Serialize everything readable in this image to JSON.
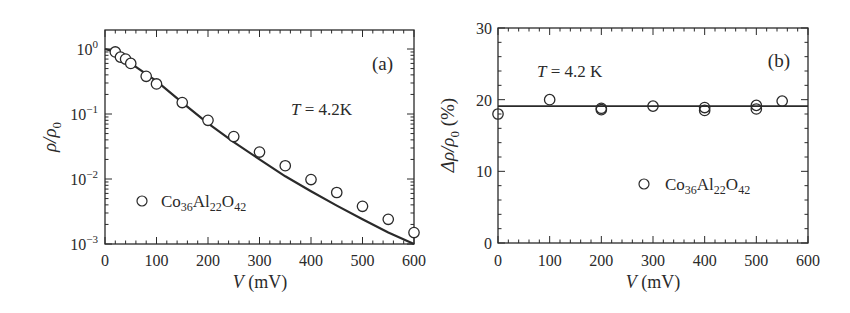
{
  "chart_data": [
    {
      "panel": "(a)",
      "type": "scatter",
      "title": "",
      "xlabel": "V (mV)",
      "ylabel": "ρ/ρ0",
      "xlim": [
        0,
        600
      ],
      "ylim": [
        0.001,
        1
      ],
      "yscale": "log",
      "xticks": [
        0,
        100,
        200,
        300,
        400,
        500,
        600
      ],
      "yticks": [
        "10^0",
        "10^-1",
        "10^-2",
        "10^-3"
      ],
      "grid": false,
      "legend_position": "lower-left inside",
      "annotations": [
        "T = 4.2K",
        "(a)"
      ],
      "series": [
        {
          "name": "Co36Al22O42",
          "marker": "open-circle",
          "x": [
            20,
            30,
            40,
            50,
            80,
            100,
            150,
            200,
            250,
            300,
            350,
            400,
            450,
            500,
            550,
            600
          ],
          "y": [
            0.9,
            0.75,
            0.7,
            0.6,
            0.38,
            0.29,
            0.15,
            0.08,
            0.045,
            0.026,
            0.016,
            0.0098,
            0.0062,
            0.0038,
            0.0024,
            0.0015
          ]
        },
        {
          "name": "fit",
          "line": "solid",
          "x": [
            0,
            10,
            50,
            100,
            150,
            200,
            250,
            300,
            350,
            400,
            450,
            500,
            550,
            600
          ],
          "y": [
            1.0,
            0.95,
            0.6,
            0.32,
            0.15,
            0.072,
            0.037,
            0.02,
            0.011,
            0.0065,
            0.0039,
            0.0024,
            0.0015,
            0.001
          ]
        }
      ]
    },
    {
      "panel": "(b)",
      "type": "scatter",
      "title": "",
      "xlabel": "V (mV)",
      "ylabel": "Δρ/ρ0 (%)",
      "xlim": [
        0,
        600
      ],
      "ylim": [
        0,
        30
      ],
      "xticks": [
        0,
        100,
        200,
        300,
        400,
        500,
        600
      ],
      "yticks": [
        0,
        10,
        20,
        30
      ],
      "grid": false,
      "legend_position": "lower-right inside",
      "annotations": [
        "T = 4.2 K",
        "(b)"
      ],
      "series": [
        {
          "name": "Co36Al22O42",
          "marker": "open-circle",
          "x": [
            0,
            100,
            200,
            200,
            300,
            400,
            400,
            500,
            500,
            550
          ],
          "y": [
            18.0,
            20.0,
            18.6,
            18.8,
            19.1,
            18.5,
            18.9,
            18.7,
            19.2,
            19.8
          ]
        },
        {
          "name": "fit",
          "line": "solid",
          "x": [
            0,
            600
          ],
          "y": [
            19.1,
            19.1
          ]
        }
      ]
    }
  ],
  "panels": {
    "a": {
      "label": "(a)",
      "temp_T": "T",
      "temp_rest": " = 4.2K",
      "ylabel_main": "ρ/ρ",
      "ylabel_sub": "0",
      "xlabel_var": "V",
      "xlabel_unit": " (mV)",
      "xtick_labels": [
        "0",
        "100",
        "200",
        "300",
        "400",
        "500",
        "600"
      ],
      "ytick_base": "10",
      "ytick_exps": [
        "0",
        "−1",
        "−2",
        "−3"
      ],
      "legend": {
        "co": "Co",
        "s1": "36",
        "al": "Al",
        "s2": "22",
        "o": "O",
        "s3": "42"
      }
    },
    "b": {
      "label": "(b)",
      "temp_T": "T",
      "temp_rest": " = 4.2 K",
      "ylabel_main": "Δρ/ρ",
      "ylabel_sub": "0",
      "ylabel_unit": " (%)",
      "xlabel_var": "V",
      "xlabel_unit": " (mV)",
      "xtick_labels": [
        "0",
        "100",
        "200",
        "300",
        "400",
        "500",
        "600"
      ],
      "ytick_labels": [
        "0",
        "10",
        "20",
        "30"
      ],
      "legend": {
        "co": "Co",
        "s1": "36",
        "al": "Al",
        "s2": "22",
        "o": "O",
        "s3": "42"
      }
    }
  },
  "colors": {
    "ink": "#2a2a2a",
    "background": "#ffffff"
  }
}
